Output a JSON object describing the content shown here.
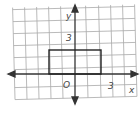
{
  "diagram": {
    "type": "coordinate-grid",
    "axis_labels": {
      "x": "x",
      "y": "y"
    },
    "origin_label": "O",
    "tick_labels": {
      "x": "3",
      "y": "3"
    },
    "shape": {
      "type": "rectangle",
      "vertices": [
        [
          -2,
          0
        ],
        [
          2,
          0
        ],
        [
          2,
          2
        ],
        [
          -2,
          2
        ]
      ]
    },
    "grid_range": {
      "x": [
        -5,
        5
      ],
      "y": [
        -2,
        6
      ]
    }
  }
}
